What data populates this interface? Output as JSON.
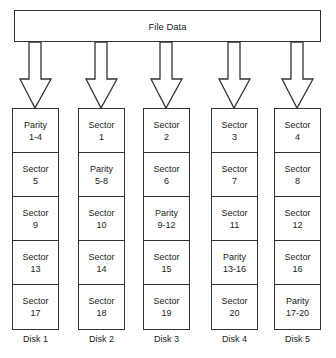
{
  "title": "File Data",
  "disks": [
    {
      "label": "Disk 1",
      "cells": [
        {
          "type": "Parity",
          "value": "1-4"
        },
        {
          "type": "Sector",
          "value": "5"
        },
        {
          "type": "Sector",
          "value": "9"
        },
        {
          "type": "Sector",
          "value": "13"
        },
        {
          "type": "Sector",
          "value": "17"
        }
      ]
    },
    {
      "label": "Disk 2",
      "cells": [
        {
          "type": "Sector",
          "value": "1"
        },
        {
          "type": "Parity",
          "value": "5-8"
        },
        {
          "type": "Sector",
          "value": "10"
        },
        {
          "type": "Sector",
          "value": "14"
        },
        {
          "type": "Sector",
          "value": "18"
        }
      ]
    },
    {
      "label": "Disk 3",
      "cells": [
        {
          "type": "Sector",
          "value": "2"
        },
        {
          "type": "Sector",
          "value": "6"
        },
        {
          "type": "Parity",
          "value": "9-12"
        },
        {
          "type": "Sector",
          "value": "15"
        },
        {
          "type": "Sector",
          "value": "19"
        }
      ]
    },
    {
      "label": "Disk 4",
      "cells": [
        {
          "type": "Sector",
          "value": "3"
        },
        {
          "type": "Sector",
          "value": "7"
        },
        {
          "type": "Sector",
          "value": "11"
        },
        {
          "type": "Parity",
          "value": "13-16"
        },
        {
          "type": "Sector",
          "value": "20"
        }
      ]
    },
    {
      "label": "Disk 5",
      "cells": [
        {
          "type": "Sector",
          "value": "4"
        },
        {
          "type": "Sector",
          "value": "8"
        },
        {
          "type": "Sector",
          "value": "12"
        },
        {
          "type": "Sector",
          "value": "16"
        },
        {
          "type": "Parity",
          "value": "17-20"
        }
      ]
    }
  ]
}
